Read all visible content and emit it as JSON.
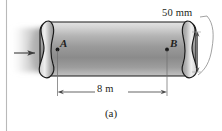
{
  "figure": {
    "caption": "(a)",
    "background_color": "#ffffff",
    "ink_color": "#231f20",
    "margin_rule_color": "#b9b9b9",
    "canvas": {
      "width": 222,
      "height": 131
    }
  },
  "diagram": {
    "vessel": {
      "name": "cylindrical-pressure-vessel",
      "body_fill_light": "#d8d8d8",
      "body_fill_mid": "#9a9a9a",
      "body_fill_dark": "#7d7d7d",
      "outline_color": "#1a1a1a",
      "left_end_style": "crimped-s-curve",
      "right_end_style": "crimped-s-curve"
    },
    "points": [
      {
        "id": "A",
        "label": "A",
        "marker": "dot"
      },
      {
        "id": "B",
        "label": "B",
        "marker": "dot"
      }
    ],
    "dimensions": [
      {
        "id": "length",
        "label": "8 m",
        "value": 8,
        "unit": "m",
        "orientation": "horizontal",
        "between": [
          "A",
          "B"
        ],
        "arrowheads": "both"
      },
      {
        "id": "diameter",
        "label": "50 mm",
        "value": 50,
        "unit": "mm",
        "orientation": "vertical",
        "location": "right-end",
        "arrowheads": "both"
      }
    ],
    "annotations": [
      {
        "id": "flow-arrow",
        "name": "inlet-flow-arrow",
        "direction": "right",
        "label": ""
      }
    ]
  }
}
